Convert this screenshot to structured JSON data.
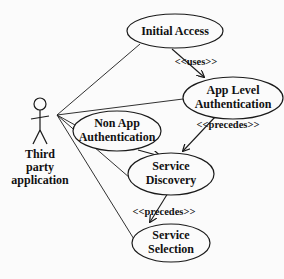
{
  "diagram": {
    "type": "uml-use-case",
    "colors": {
      "background": "#fbfbfb",
      "stroke": "#1a1a1a",
      "text": "#111111"
    },
    "actor": {
      "label_lines": [
        "Third",
        "party",
        "application"
      ]
    },
    "use_cases": [
      {
        "id": "initial-access",
        "lines": [
          "Initial Access"
        ]
      },
      {
        "id": "app-level-auth",
        "lines": [
          "App Level",
          "Authentication"
        ]
      },
      {
        "id": "non-app-auth",
        "lines": [
          "Non App",
          "Authentication"
        ]
      },
      {
        "id": "service-discovery",
        "lines": [
          "Service",
          "Discovery"
        ]
      },
      {
        "id": "service-selection",
        "lines": [
          "Service",
          "Selection"
        ]
      }
    ],
    "relationships": [
      {
        "from": "initial-access",
        "to": "app-level-auth",
        "label": "<<uses>>"
      },
      {
        "from": "app-level-auth",
        "to": "service-discovery",
        "label": "<<precedes>>"
      },
      {
        "from": "non-app-auth",
        "to": "service-discovery",
        "label": ""
      },
      {
        "from": "service-discovery",
        "to": "service-selection",
        "label": "<<precedes>>"
      }
    ],
    "associations": [
      "initial-access",
      "app-level-auth",
      "non-app-auth",
      "service-discovery",
      "service-selection"
    ]
  }
}
